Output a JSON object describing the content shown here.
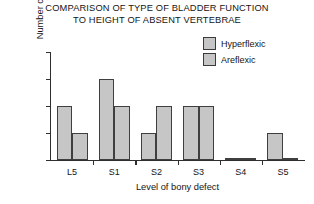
{
  "chart_data": {
    "type": "bar",
    "title": "COMPARISON OF TYPE OF BLADDER FUNCTION\nTO HEIGHT OF ABSENT VERTEBRAE",
    "xlabel": "Level of bony defect",
    "ylabel": "Number of children",
    "categories": [
      "L5",
      "S1",
      "S2",
      "S3",
      "S4",
      "S5"
    ],
    "series": [
      {
        "name": "Hyperflexic",
        "values": [
          2,
          3,
          1,
          2,
          0.05,
          1
        ],
        "color": "#c6c6c6"
      },
      {
        "name": "Areflexic",
        "values": [
          1,
          2,
          2,
          2,
          0.05,
          0.05
        ],
        "color": "#c6c6c6"
      }
    ],
    "ylim": [
      0,
      4
    ],
    "yticks": [
      0,
      1,
      2,
      3,
      4
    ],
    "ytick_labels": [
      "0",
      "1",
      "2",
      "3",
      "4"
    ],
    "grid": false,
    "legend_position": "top-right",
    "bar_border_color": "#3f3f3f"
  },
  "legend": {
    "items": [
      {
        "label": "Hyperflexic"
      },
      {
        "label": "Areflexic"
      }
    ]
  }
}
